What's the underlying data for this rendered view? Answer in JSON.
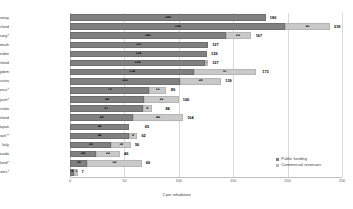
{
  "chart_data": {
    "type": "bar",
    "orientation": "horizontal",
    "stacked": true,
    "title": "",
    "xlabel": "€ per inhabitant",
    "ylabel": "",
    "xlim": [
      0,
      250
    ],
    "xticks": [
      0,
      50,
      100,
      150,
      200,
      250
    ],
    "grid": true,
    "legend_position": "bottom-right",
    "categories": [
      "Norway",
      "Switzerland",
      "Germany*",
      "Denmark",
      "Sweden",
      "Finland",
      "United Kingdom",
      "Austria",
      "France*",
      "Belgium*",
      "Australia",
      "Ireland",
      "Japan",
      "Spain**",
      "Italy",
      "Canada",
      "New Zealand*",
      "United States*"
    ],
    "series": [
      {
        "name": "Public funding",
        "color": "#808080",
        "values": [
          180,
          198,
          143,
          127,
          126,
          124,
          114,
          101,
          73,
          68,
          67,
          58,
          54,
          54,
          38,
          24,
          16,
          4
        ]
      },
      {
        "name": "Commercial revenues",
        "color": "#c9c9c9",
        "values": [
          0,
          41,
          23,
          0,
          0,
          3,
          57,
          38,
          15,
          32,
          8,
          46,
          0,
          8,
          18,
          22,
          50,
          3
        ]
      }
    ],
    "totals": [
      180,
      239,
      167,
      127,
      126,
      127,
      173,
      139,
      89,
      100,
      84,
      104,
      65,
      62,
      56,
      46,
      66,
      7
    ]
  },
  "legend": {
    "items": [
      {
        "label": "Public funding",
        "swatch": "public-funding-swatch"
      },
      {
        "label": "Commercial revenues",
        "swatch": "commercial-revenues-swatch"
      }
    ]
  }
}
